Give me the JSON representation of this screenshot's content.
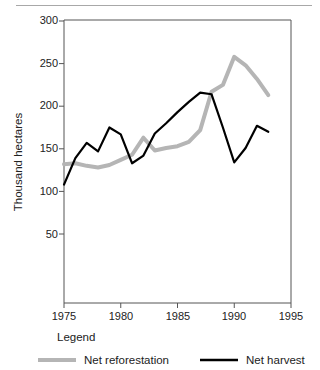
{
  "figure": {
    "background_color": "#ffffff",
    "top_rule_color": "#a8a8a8",
    "axis_color": "#555555"
  },
  "axis": {
    "y_title": "Thousand hectares",
    "y_ticks": [
      "300",
      "250",
      "200",
      "150",
      "100",
      "50"
    ],
    "x_ticks": [
      "1975",
      "1980",
      "1985",
      "1990",
      "1995"
    ]
  },
  "legend": {
    "title": "Legend",
    "items": [
      {
        "label": "Net reforestation",
        "color": "#b5b5b5"
      },
      {
        "label": "Net harvest",
        "color": "#000000"
      }
    ]
  },
  "chart_data": {
    "type": "line",
    "title": "",
    "subtitle": "",
    "xlabel": "",
    "ylabel": "Thousand hectares",
    "xlim": [
      1975,
      1995
    ],
    "ylim": [
      0,
      300
    ],
    "x_ticks": [
      1975,
      1980,
      1985,
      1990,
      1995
    ],
    "y_ticks": [
      50,
      100,
      150,
      200,
      250,
      300
    ],
    "grid": false,
    "legend_position": "bottom",
    "x": [
      1975,
      1976,
      1977,
      1978,
      1979,
      1980,
      1981,
      1982,
      1983,
      1984,
      1985,
      1986,
      1987,
      1988,
      1989,
      1990,
      1991,
      1992,
      1993
    ],
    "series": [
      {
        "name": "Net reforestation",
        "color": "#b5b5b5",
        "values": [
          132,
          133,
          130,
          128,
          131,
          137,
          143,
          163,
          148,
          151,
          153,
          158,
          172,
          217,
          225,
          258,
          248,
          232,
          213
        ]
      },
      {
        "name": "Net harvest",
        "color": "#000000",
        "values": [
          108,
          139,
          157,
          147,
          175,
          167,
          133,
          142,
          168,
          180,
          193,
          205,
          216,
          214,
          175,
          134,
          151,
          177,
          170
        ]
      }
    ]
  }
}
